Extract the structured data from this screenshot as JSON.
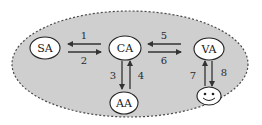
{
  "diagram": {
    "type": "agent-interaction-diagram",
    "colors": {
      "background": "#ffffff",
      "region_fill": "#cfcfcf",
      "region_border": "#4a4a4a",
      "node_fill": "#ffffff",
      "node_border": "#222222",
      "arrow": "#333333"
    },
    "nodes": [
      {
        "id": "SA",
        "label": "SA"
      },
      {
        "id": "CA",
        "label": "CA"
      },
      {
        "id": "VA",
        "label": "VA"
      },
      {
        "id": "AA",
        "label": "AA"
      },
      {
        "id": "user",
        "label": "",
        "icon": "smiley-face-icon"
      }
    ],
    "edges": [
      {
        "label": "1",
        "from": "CA",
        "to": "SA"
      },
      {
        "label": "2",
        "from": "SA",
        "to": "CA"
      },
      {
        "label": "3",
        "from": "CA",
        "to": "AA"
      },
      {
        "label": "4",
        "from": "AA",
        "to": "CA"
      },
      {
        "label": "5",
        "from": "VA",
        "to": "CA"
      },
      {
        "label": "6",
        "from": "CA",
        "to": "VA"
      },
      {
        "label": "7",
        "from": "user",
        "to": "VA"
      },
      {
        "label": "8",
        "from": "VA",
        "to": "user"
      }
    ]
  }
}
